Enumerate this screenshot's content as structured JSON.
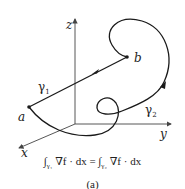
{
  "figure": {
    "axes": {
      "x_label": "x",
      "y_label": "y",
      "z_label": "z"
    },
    "points": {
      "start": "a",
      "end": "b"
    },
    "paths": {
      "path1": "γ",
      "path1_sub": "1",
      "path2": "γ",
      "path2_sub": "2"
    },
    "equation": {
      "lhs_int": "∫",
      "lhs_sub": "γ₁",
      "lhs_body": " ∇f · dx = ",
      "rhs_int": "∫",
      "rhs_sub": "γ₂",
      "rhs_body": " ∇f · dx"
    },
    "caption": "(a)",
    "colors": {
      "stroke": "#1a1a1a",
      "axis": "#444444"
    }
  }
}
